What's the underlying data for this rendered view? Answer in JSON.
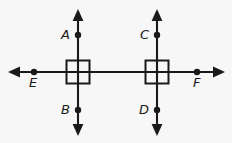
{
  "figure": {
    "background_color": "#f7f7f7",
    "stroke_color": "#1a1a1a",
    "width": 232,
    "height": 143,
    "lines": [
      {
        "name": "horizontal-line-EF",
        "orientation": "horizontal",
        "x1": 11,
        "y1": 72,
        "x2": 222,
        "y2": 72,
        "arrow_start": true,
        "arrow_end": true
      },
      {
        "name": "vertical-line-AB",
        "orientation": "vertical",
        "x1": 78,
        "y1": 12,
        "x2": 78,
        "y2": 133,
        "arrow_start": true,
        "arrow_end": true
      },
      {
        "name": "vertical-line-CD",
        "orientation": "vertical",
        "x1": 157,
        "y1": 12,
        "x2": 157,
        "y2": 133,
        "arrow_start": true,
        "arrow_end": true
      }
    ],
    "right_angle_marks": [
      {
        "name": "right-angle-mark-left",
        "cx": 78,
        "cy": 72,
        "size": 23
      },
      {
        "name": "right-angle-mark-right",
        "cx": 157,
        "cy": 72,
        "size": 23
      }
    ],
    "points": [
      {
        "label": "A",
        "cx": 78,
        "cy": 35,
        "label_x": 61,
        "label_y": 28,
        "label_position": "left"
      },
      {
        "label": "B",
        "cx": 78,
        "cy": 110,
        "label_x": 61,
        "label_y": 103,
        "label_position": "left"
      },
      {
        "label": "C",
        "cx": 157,
        "cy": 35,
        "label_x": 140,
        "label_y": 28,
        "label_position": "left"
      },
      {
        "label": "D",
        "cx": 157,
        "cy": 110,
        "label_x": 139,
        "label_y": 103,
        "label_position": "left"
      },
      {
        "label": "E",
        "cx": 34,
        "cy": 72,
        "label_x": 29,
        "label_y": 76,
        "label_position": "below"
      },
      {
        "label": "F",
        "cx": 197,
        "cy": 72,
        "label_x": 193,
        "label_y": 76,
        "label_position": "below"
      }
    ],
    "point_radius": 3.2
  }
}
